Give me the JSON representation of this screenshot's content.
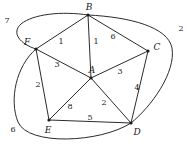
{
  "diagram": {
    "stroke_color": "#2b2b2b",
    "text_color": "#1a1a1a",
    "background": "#ffffff",
    "vertices": [
      {
        "id": "A",
        "label": "A",
        "x": 91,
        "y": 78,
        "label_x": 92,
        "label_y": 70
      },
      {
        "id": "B",
        "label": "B",
        "x": 88,
        "y": 15,
        "label_x": 89,
        "label_y": 7
      },
      {
        "id": "C",
        "label": "C",
        "x": 148,
        "y": 51,
        "label_x": 157,
        "label_y": 47
      },
      {
        "id": "D",
        "label": "D",
        "x": 131,
        "y": 123,
        "label_x": 137,
        "label_y": 132
      },
      {
        "id": "E",
        "label": "E",
        "x": 49,
        "y": 120,
        "label_x": 48,
        "label_y": 130
      },
      {
        "id": "F",
        "label": "F",
        "x": 36,
        "y": 49,
        "label_x": 27,
        "label_y": 42
      }
    ],
    "inner_edges": [
      {
        "from": "F",
        "to": "B",
        "weight": "1",
        "label_x": 61,
        "label_y": 42
      },
      {
        "from": "B",
        "to": "A",
        "weight": "1",
        "label_x": 96,
        "label_y": 42
      },
      {
        "from": "B",
        "to": "C",
        "weight": "6",
        "label_x": 113,
        "label_y": 37
      },
      {
        "from": "F",
        "to": "A",
        "weight": "3",
        "label_x": 57,
        "label_y": 65
      },
      {
        "from": "A",
        "to": "C",
        "weight": "3",
        "label_x": 120,
        "label_y": 72
      },
      {
        "from": "C",
        "to": "D",
        "weight": "4",
        "label_x": 137,
        "label_y": 88
      },
      {
        "from": "F",
        "to": "E",
        "weight": "2",
        "label_x": 38,
        "label_y": 85
      },
      {
        "from": "A",
        "to": "E",
        "weight": "8",
        "label_x": 70,
        "label_y": 107
      },
      {
        "from": "A",
        "to": "D",
        "weight": "2",
        "label_x": 104,
        "label_y": 103
      },
      {
        "from": "E",
        "to": "D",
        "weight": "5",
        "label_x": 90,
        "label_y": 118
      }
    ],
    "outer_edges": [
      {
        "from": "F",
        "to": "B",
        "weight": "7",
        "label_x": 7,
        "label_y": 21,
        "path": "M 36 49 C 20 44 11 33 21 24 C 33 14 62 11 88 15"
      },
      {
        "from": "B",
        "to": "D",
        "weight": "2",
        "label_x": 181,
        "label_y": 29,
        "path": "M 88 15 C 130 17 168 27 172 48 C 176 72 152 106 131 123"
      },
      {
        "from": "F",
        "to": "E",
        "weight": "6",
        "label_x": 13,
        "label_y": 130,
        "path": "M 36 49 C 16 66 9 100 18 122 C 28 146 100 143 131 123"
      }
    ]
  }
}
